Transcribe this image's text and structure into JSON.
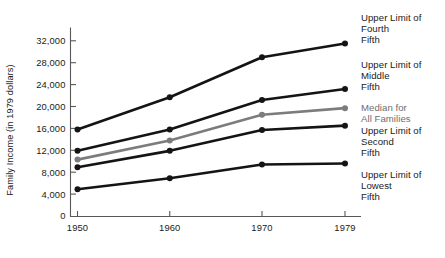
{
  "chart_data": {
    "type": "line",
    "title": "",
    "xlabel": "",
    "ylabel": "Family Income (in 1979 dollars)",
    "x": [
      1950,
      1960,
      1970,
      1979
    ],
    "categories": [
      "1950",
      "1960",
      "1970",
      "1979"
    ],
    "xtick_labels": [
      "1950",
      "1960",
      "1970",
      "1979"
    ],
    "ytick_labels": [
      "0",
      "4,000",
      "8,000",
      "12,000",
      "16,000",
      "20,000",
      "24,000",
      "28,000",
      "32,000"
    ],
    "ytick_values": [
      0,
      4000,
      8000,
      12000,
      16000,
      20000,
      24000,
      28000,
      32000
    ],
    "ylim": [
      0,
      34000
    ],
    "xlim": [
      1947,
      1981
    ],
    "grid": false,
    "legend_position": "right",
    "series": [
      {
        "name": "Upper Limit of Fourth Fifth",
        "label_lines": [
          "Upper Limit of",
          "Fourth",
          "Fifth"
        ],
        "color": "#141414",
        "values": [
          15800,
          21700,
          29000,
          31500
        ]
      },
      {
        "name": "Upper Limit of Middle Fifth",
        "label_lines": [
          "Upper Limit of",
          "Middle",
          "Fifth"
        ],
        "color": "#141414",
        "values": [
          11900,
          15800,
          21200,
          23200
        ]
      },
      {
        "name": "Median for All Families",
        "label_lines": [
          "Median for",
          "All Families"
        ],
        "color": "#7c7c7e",
        "values": [
          10300,
          13800,
          18500,
          19700
        ]
      },
      {
        "name": "Upper Limit of Second Fifth",
        "label_lines": [
          "Upper Limit of",
          "Second",
          "Fifth"
        ],
        "color": "#141414",
        "values": [
          8900,
          11900,
          15700,
          16500
        ]
      },
      {
        "name": "Upper Limit of Lowest Fifth",
        "label_lines": [
          "Upper Limit of",
          "Lowest",
          "Fifth"
        ],
        "color": "#141414",
        "values": [
          4900,
          6900,
          9400,
          9600
        ]
      }
    ]
  }
}
